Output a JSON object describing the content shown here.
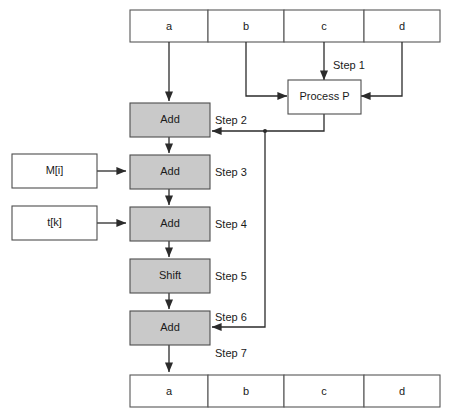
{
  "diagram": {
    "colors": {
      "process_fill": "#c9c9c9",
      "input_fill": "#ffffff",
      "register_fill": "#ffffff",
      "line": "#2b2b2b",
      "border": "#4d4d4d",
      "text": "#1a1a1a",
      "background": "#ffffff"
    },
    "register_top": {
      "name": "top-register",
      "cells": [
        {
          "label": "a"
        },
        {
          "label": "b"
        },
        {
          "label": "c"
        },
        {
          "label": "d"
        }
      ]
    },
    "register_bottom": {
      "name": "bottom-register",
      "cells": [
        {
          "label": "a"
        },
        {
          "label": "b"
        },
        {
          "label": "c"
        },
        {
          "label": "d"
        }
      ]
    },
    "process_box": {
      "label": "Process P",
      "style": "white"
    },
    "pipeline": [
      {
        "label": "Add",
        "style": "gray"
      },
      {
        "label": "Add",
        "style": "gray"
      },
      {
        "label": "Add",
        "style": "gray"
      },
      {
        "label": "Shift",
        "style": "gray"
      },
      {
        "label": "Add",
        "style": "gray"
      }
    ],
    "inputs": [
      {
        "label": "M[i]",
        "style": "white",
        "target": "add-2"
      },
      {
        "label": "t[k]",
        "style": "white",
        "target": "add-3"
      }
    ],
    "steps": [
      {
        "label": "Step 1"
      },
      {
        "label": "Step 2"
      },
      {
        "label": "Step 3"
      },
      {
        "label": "Step 4"
      },
      {
        "label": "Step 5"
      },
      {
        "label": "Step 6"
      },
      {
        "label": "Step 7"
      }
    ]
  }
}
